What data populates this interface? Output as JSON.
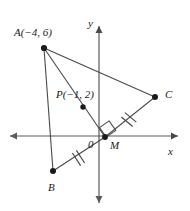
{
  "figure": {
    "type": "geometry-diagram",
    "stroke_color": "#4a4a4a",
    "point_color": "#1a1a1a",
    "background": "#ffffff"
  },
  "axes": {
    "x_label": "x",
    "y_label": "y",
    "origin_label": "0",
    "origin_px": {
      "x": 99,
      "y": 136
    }
  },
  "points": [
    {
      "id": "A",
      "label": "A(−4, 6)",
      "name": "A",
      "coords": [
        -4,
        6
      ],
      "px": {
        "x": 44,
        "y": 48
      },
      "label_px": {
        "x": 14,
        "y": 27
      }
    },
    {
      "id": "P",
      "label": "P(−1, 2)",
      "name": "P",
      "coords": [
        -1,
        2
      ],
      "px": {
        "x": 83,
        "y": 107
      },
      "label_px": {
        "x": 56,
        "y": 89
      }
    },
    {
      "id": "B",
      "label": "B",
      "name": "B",
      "coords": null,
      "px": {
        "x": 53,
        "y": 171
      },
      "label_px": {
        "x": 48,
        "y": 184
      }
    },
    {
      "id": "C",
      "label": "C",
      "name": "C",
      "coords": null,
      "px": {
        "x": 155,
        "y": 97
      },
      "label_px": {
        "x": 165,
        "y": 92
      }
    },
    {
      "id": "M",
      "label": "M",
      "name": "M",
      "coords": null,
      "px": {
        "x": 105,
        "y": 137
      },
      "label_px": {
        "x": 110,
        "y": 143
      }
    }
  ],
  "segments": [
    {
      "id": "AB",
      "from": "A",
      "to": "B",
      "ticks": 0
    },
    {
      "id": "AC",
      "from": "A",
      "to": "C",
      "ticks": 0
    },
    {
      "id": "AM",
      "from": "A",
      "to": "M",
      "ticks": 0
    },
    {
      "id": "BM",
      "from": "B",
      "to": "M",
      "ticks": 2
    },
    {
      "id": "MC",
      "from": "M",
      "to": "C",
      "ticks": 2
    }
  ],
  "markers": {
    "right_angle_at": "M",
    "right_angle_between": [
      "AM",
      "BC"
    ],
    "congruent_ticks": "BM = MC (double tick marks)"
  },
  "labels": {
    "A": "A(−4, 6)",
    "P": "P(−1, 2)",
    "B": "B",
    "C": "C",
    "M": "M",
    "origin": "0",
    "x_axis": "x",
    "y_axis": "y"
  }
}
